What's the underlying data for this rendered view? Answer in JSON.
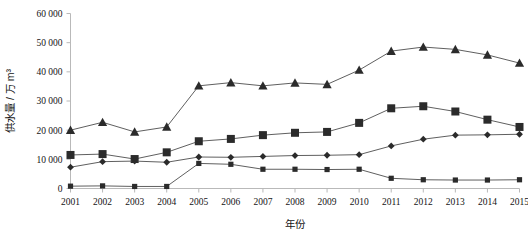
{
  "chart_data": {
    "type": "line",
    "title": "",
    "xlabel": "年份",
    "ylabel": "供水量 / 万 m³",
    "x": [
      2001,
      2002,
      2003,
      2004,
      2005,
      2006,
      2007,
      2008,
      2009,
      2010,
      2011,
      2012,
      2013,
      2014,
      2015
    ],
    "categories": [
      "2001",
      "2002",
      "2003",
      "2004",
      "2005",
      "2006",
      "2007",
      "2008",
      "2009",
      "2010",
      "2011",
      "2012",
      "2013",
      "2014",
      "2015"
    ],
    "ylim": [
      0,
      60000
    ],
    "xlim": [
      2001,
      2015
    ],
    "yticks": [
      0,
      10000,
      20000,
      30000,
      40000,
      50000,
      60000
    ],
    "ytick_labels": [
      "0",
      "10 000",
      "20 000",
      "30 000",
      "40 000",
      "50 000",
      "60 000"
    ],
    "grid": false,
    "legend": "none",
    "series": [
      {
        "name": "series-triangle",
        "marker": "triangle",
        "values": [
          20000,
          22700,
          19400,
          21100,
          35200,
          36300,
          35200,
          36200,
          35700,
          40600,
          47100,
          48500,
          47700,
          45800,
          43000
        ]
      },
      {
        "name": "series-square",
        "marker": "square",
        "values": [
          11500,
          11800,
          10100,
          12400,
          16200,
          17000,
          18300,
          19100,
          19400,
          22500,
          27500,
          28200,
          26400,
          23600,
          21100
        ]
      },
      {
        "name": "series-diamond",
        "marker": "diamond",
        "values": [
          7300,
          9200,
          9400,
          9000,
          10800,
          10700,
          11000,
          11300,
          11400,
          11600,
          14600,
          16900,
          18300,
          18400,
          18600
        ]
      },
      {
        "name": "series-small-square",
        "marker": "small-square",
        "values": [
          800,
          900,
          700,
          700,
          8600,
          8300,
          6600,
          6600,
          6500,
          6600,
          3500,
          3000,
          2900,
          2900,
          3000
        ]
      }
    ]
  },
  "axes": {
    "y_title": "供水量 / 万 m³",
    "x_title": "年份",
    "y_tick_labels": [
      "60 000",
      "50 000",
      "40 000",
      "30 000",
      "20 000",
      "10 000",
      "0"
    ],
    "x_tick_labels": [
      "2001",
      "2002",
      "2003",
      "2004",
      "2005",
      "2006",
      "2007",
      "2008",
      "2009",
      "2010",
      "2011",
      "2012",
      "2013",
      "2014",
      "2015"
    ]
  },
  "colors": {
    "marker": "#2b2b2b",
    "line": "#4d4d4d",
    "axis": "#b9b9b9",
    "text": "#141414",
    "background": "#ffffff"
  }
}
